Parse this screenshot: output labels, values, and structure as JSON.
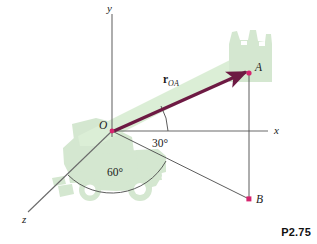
{
  "figure": {
    "caption": "P2.75",
    "axes": [
      {
        "name": "y",
        "label": "y"
      },
      {
        "name": "x",
        "label": "x"
      },
      {
        "name": "z",
        "label": "z"
      }
    ],
    "points": [
      {
        "id": "O",
        "label": "O",
        "role": "origin"
      },
      {
        "id": "A",
        "label": "A",
        "role": "vector-tip"
      },
      {
        "id": "B",
        "label": "B",
        "role": "projection-point"
      }
    ],
    "vector": {
      "symbol": "r",
      "subscript": "OA",
      "from": "O",
      "to": "A"
    },
    "angles": [
      {
        "name": "angle-from-x-axis",
        "label": "30°",
        "value": 30
      },
      {
        "name": "angle-in-xz-plane",
        "label": "60°",
        "value": 60
      }
    ],
    "colors": {
      "vector": "#6d1a43",
      "point_marker": "#d6246e",
      "machine_silhouette": "#d3e6cf",
      "boom_silhouette": "#d9ebd4",
      "axis_line": "#6b6b6b",
      "construction_line": "#4a4a4a",
      "background": "#ffffff",
      "text": "#1a1a1a"
    }
  }
}
